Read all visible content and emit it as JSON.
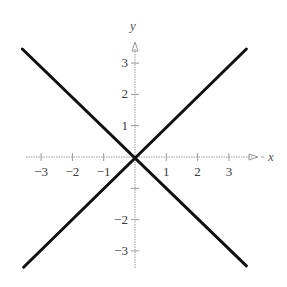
{
  "chart_data": {
    "type": "line",
    "title": "",
    "xlabel": "x",
    "ylabel": "y",
    "xlim": [
      -3.5,
      3.9
    ],
    "ylim": [
      -3.6,
      3.7
    ],
    "grid": false,
    "legend": null,
    "x_ticks": [
      -3,
      -2,
      -1,
      1,
      2,
      3
    ],
    "x_tick_labels": [
      "−3",
      "−2",
      "−1",
      "1",
      "2",
      "3"
    ],
    "y_ticks": [
      3,
      2,
      1,
      -1,
      -2,
      -3
    ],
    "y_tick_labels": [
      "3",
      "2",
      "1",
      "",
      "−2",
      "−3"
    ],
    "series": [
      {
        "name": "y = x",
        "x": [
          -3.56,
          3.56
        ],
        "y": [
          -3.52,
          3.45
        ],
        "color": "#111111",
        "stroke_width": 3
      },
      {
        "name": "y = -x",
        "x": [
          -3.6,
          3.56
        ],
        "y": [
          3.45,
          -3.48
        ],
        "color": "#111111",
        "stroke_width": 3
      }
    ]
  },
  "layout": {
    "origin_px": [
      135,
      157
    ],
    "unit_px": 31.3,
    "x_axis_px": [
      26,
      258
    ],
    "y_axis_px": [
      268,
      42
    ],
    "axis_color": "#9a9a9a"
  }
}
